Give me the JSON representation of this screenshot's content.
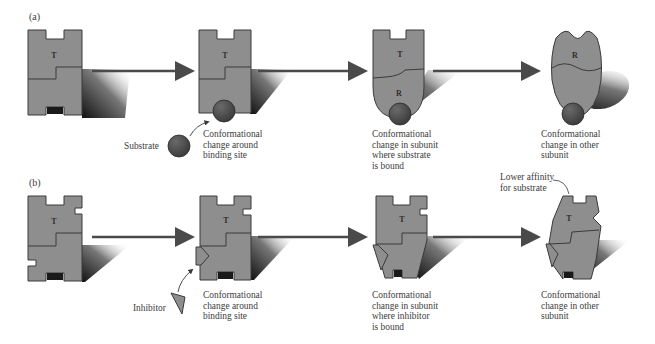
{
  "figure": {
    "panels": [
      {
        "id": "a",
        "label": "(a)",
        "stages": [
          {
            "subunit_label": "T",
            "caption": []
          },
          {
            "subunit_label": "T",
            "caption": [
              "Conformational",
              "change around",
              "binding site"
            ]
          },
          {
            "subunit_label_top": "T",
            "subunit_label_bottom": "R",
            "caption": [
              "Conformational",
              "change in subunit",
              "where substrate",
              "is bound"
            ]
          },
          {
            "subunit_label": "R",
            "caption": [
              "Conformational",
              "change in other",
              "subunit"
            ]
          }
        ],
        "ligand_label": "Substrate"
      },
      {
        "id": "b",
        "label": "(b)",
        "stages": [
          {
            "subunit_label": "T",
            "caption": []
          },
          {
            "subunit_label": "T",
            "caption": [
              "Conformational",
              "change around",
              "binding site"
            ]
          },
          {
            "subunit_label": "T",
            "caption": [
              "Conformational",
              "change in subunit",
              "where inhibitor",
              "is bound"
            ]
          },
          {
            "subunit_label": "T",
            "caption": [
              "Conformational",
              "change in other",
              "subunit"
            ]
          }
        ],
        "ligand_label": "Inhibitor",
        "callout": [
          "Lower affinity",
          "for substrate"
        ]
      }
    ],
    "colors": {
      "subunit_fill": "#8e8e8e",
      "subunit_stroke": "#3a3a3a",
      "ligand_fill": "#4a4a4a",
      "arrow": "#4a4a4a",
      "shadow": "#1e1e1e"
    }
  }
}
